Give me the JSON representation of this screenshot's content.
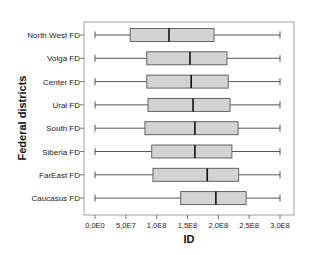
{
  "chart_data": {
    "type": "boxplot",
    "orientation": "horizontal",
    "title": "",
    "xlabel": "ID",
    "ylabel": "Federal districts",
    "xlim": [
      0,
      300000000
    ],
    "x_ticks": [
      0,
      50000000,
      100000000,
      150000000,
      200000000,
      250000000,
      300000000
    ],
    "x_tick_labels": [
      "0,0E0",
      "5,0E7",
      "1,0E8",
      "1,5E8",
      "2,0E8",
      "2,5E8",
      "3,0E8"
    ],
    "grid": false,
    "legend": null,
    "categories": [
      "North West FD",
      "Volga FD",
      "Center FD",
      "Ural FD",
      "South FD",
      "Siberia FD",
      "FarEast FD",
      "Caucasus FD"
    ],
    "series": [
      {
        "name": "North West FD",
        "min": 0,
        "q1": 57000000,
        "median": 120000000,
        "q3": 193000000,
        "max": 300000000
      },
      {
        "name": "Volga FD",
        "min": 0,
        "q1": 84000000,
        "median": 154000000,
        "q3": 214000000,
        "max": 300000000
      },
      {
        "name": "Center FD",
        "min": 0,
        "q1": 84000000,
        "median": 156000000,
        "q3": 216000000,
        "max": 300000000
      },
      {
        "name": "Ural FD",
        "min": 0,
        "q1": 86000000,
        "median": 159000000,
        "q3": 219000000,
        "max": 300000000
      },
      {
        "name": "South FD",
        "min": 0,
        "q1": 81000000,
        "median": 162000000,
        "q3": 232000000,
        "max": 300000000
      },
      {
        "name": "Siberia FD",
        "min": 0,
        "q1": 92000000,
        "median": 162000000,
        "q3": 222000000,
        "max": 300000000
      },
      {
        "name": "FarEast FD",
        "min": 0,
        "q1": 94000000,
        "median": 182000000,
        "q3": 233000000,
        "max": 300000000
      },
      {
        "name": "Caucasus FD",
        "min": 0,
        "q1": 139000000,
        "median": 196000000,
        "q3": 245000000,
        "max": 300000000
      }
    ],
    "colors": {
      "box_fill": "#d3d3d3",
      "box_stroke": "#555555",
      "median": "#111111",
      "whisker": "#555555",
      "frame": "#888888"
    }
  }
}
